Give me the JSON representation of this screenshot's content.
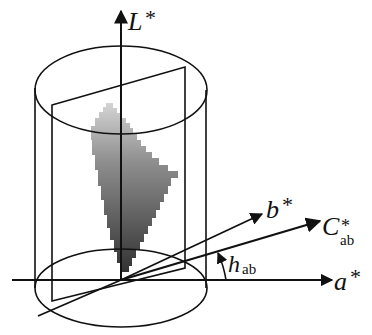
{
  "diagram": {
    "labels": {
      "l_axis": "L",
      "l_axis_star": "*",
      "b_axis": "b",
      "b_axis_star": "*",
      "c_axis": "C",
      "c_axis_star": "*",
      "c_axis_sub": "ab",
      "a_axis": "a",
      "a_axis_star": "*",
      "h_angle": "h",
      "h_angle_sub": "ab"
    },
    "elements": [
      "cylinder (top and bottom ellipses, vertical sides)",
      "L* vertical axis with arrow",
      "a* horizontal axis with arrow",
      "b* axis with arrow",
      "C*ab chroma axis with arrow",
      "vertical hue plane rectangle",
      "gray gradient gamut slice (stair-stepped)",
      "hue angle arc h_ab with arrow"
    ],
    "colors": {
      "stroke": "#111111",
      "gamut_light": "#cfcfcf",
      "gamut_dark": "#3a3a3a",
      "background": "#ffffff"
    }
  }
}
